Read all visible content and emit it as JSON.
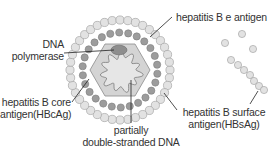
{
  "diagram": {
    "labels": {
      "e_antigen": [
        "hepatitis B e antigen"
      ],
      "dna_polymerase": [
        "DNA",
        "polymerase"
      ],
      "core_antigen": [
        "hepatitis B core",
        "antigen(HBcAg)"
      ],
      "ds_dna": [
        "partially",
        "double-stranded DNA"
      ],
      "surface_antigen": [
        "hepatitis B surface",
        "antigen(HBsAg)"
      ]
    },
    "colors": {
      "outer_bead_fill": "#e2e2e2",
      "outer_bead_stroke": "#9a9a9a",
      "inner_bead_fill": "#9c9c9c",
      "hexagon_fill": "#d4d4d4",
      "hexagon_stroke": "#8a8a8a",
      "dna_fill": "#e6e6e6",
      "polymerase_fill": "#8e8e8e",
      "leader_line": "#222222",
      "text": "#333333"
    },
    "geometry": {
      "center": [
        120,
        70
      ],
      "outer_ring_radius": 50,
      "outer_ring_beads": 40,
      "inner_ring_radius": 37.5,
      "inner_ring_beads": 26,
      "hexagon_radius": 30
    },
    "free_surface_antigen_beads": [
      [
        225,
        43
      ],
      [
        242,
        34
      ],
      [
        253,
        49
      ],
      [
        231,
        60
      ],
      [
        238,
        65
      ],
      [
        244,
        70
      ],
      [
        250,
        75
      ],
      [
        254,
        81
      ],
      [
        259,
        86
      ],
      [
        264,
        90
      ]
    ]
  }
}
